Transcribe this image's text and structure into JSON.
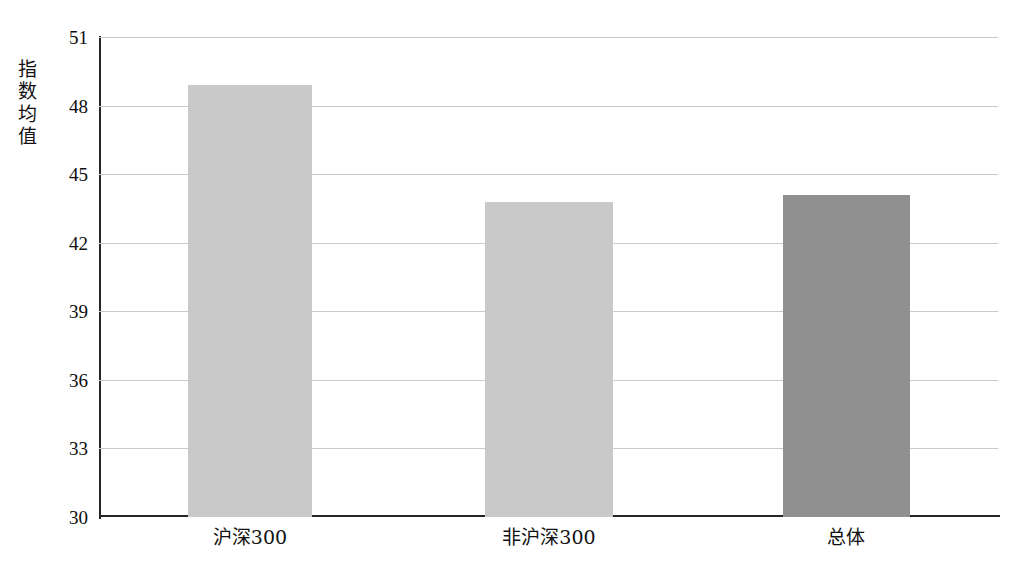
{
  "chart_data": {
    "type": "bar",
    "title": "",
    "subtitle": "",
    "xlabel": "",
    "ylabel": "指数均值",
    "categories": [
      "沪深300",
      "非沪深300",
      "总体"
    ],
    "values": [
      48.9,
      43.8,
      44.1
    ],
    "series": [
      {
        "name": "指数均值",
        "values": [
          48.9,
          43.8,
          44.1
        ]
      }
    ],
    "ylim": [
      30,
      51
    ],
    "yticks": [
      30,
      33,
      36,
      39,
      42,
      45,
      48,
      51
    ],
    "ytick_labels": [
      "30",
      "33",
      "36",
      "39",
      "42",
      "45",
      "48",
      "51"
    ],
    "grid": true,
    "grid_axis": "y",
    "legend": false,
    "legend_position": "none",
    "annotations": [],
    "bar_colors": [
      "#c9c9c9",
      "#c9c9c9",
      "#909090"
    ],
    "colors": {
      "bar_light": "#c9c9c9",
      "bar_dark": "#909090",
      "gridline": "#c9c9c9",
      "axis": "#262626",
      "text": "#111111",
      "background": "#ffffff"
    }
  }
}
